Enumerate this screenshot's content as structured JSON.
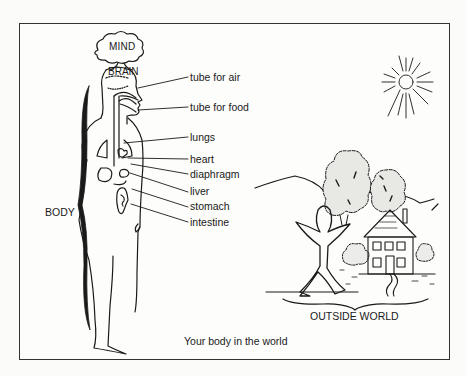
{
  "diagram": {
    "title_caption": "Your body in the world",
    "head_labels": {
      "mind": "MIND",
      "brain": "BRAIN"
    },
    "body_label": "BODY",
    "outside_world_label": "OUTSIDE WORLD",
    "organ_labels": [
      {
        "id": "tube-for-air",
        "label": "tube for air"
      },
      {
        "id": "tube-for-food",
        "label": "tube for food"
      },
      {
        "id": "lungs",
        "label": "lungs"
      },
      {
        "id": "heart",
        "label": "heart"
      },
      {
        "id": "diaphragm",
        "label": "diaphragm"
      },
      {
        "id": "liver",
        "label": "liver"
      },
      {
        "id": "stomach",
        "label": "stomach"
      },
      {
        "id": "intestine",
        "label": "intestine"
      }
    ],
    "scene_elements": [
      "sun",
      "trees",
      "hills",
      "house",
      "bushes",
      "human-figure",
      "path"
    ],
    "colors": {
      "ink": "#1a1a1a",
      "paper": "#fdfdfb",
      "frame": "#333333"
    }
  }
}
